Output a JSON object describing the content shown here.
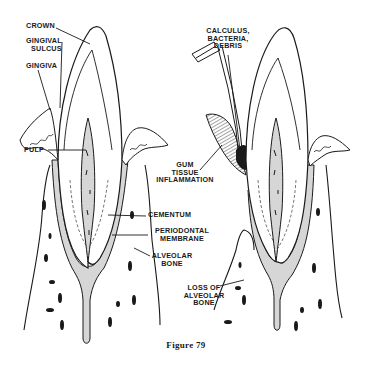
{
  "figure": {
    "caption": "Figure 79",
    "colors": {
      "ink": "#1a1a1a",
      "shading": "#d6d6d6",
      "background": "#ffffff"
    },
    "left_tooth": {
      "title": "Healthy tooth",
      "labels": {
        "crown": "CROWN",
        "gingival_sulcus_1": "GINGIVAL",
        "gingival_sulcus_2": "SULCUS",
        "gingiva": "GINGIVA",
        "pulp": "PULP",
        "cementum": "CEMENTUM",
        "periodontal_1": "PERIODONTAL",
        "periodontal_2": "MEMBRANE",
        "alveolar_1": "ALVEOLAR",
        "alveolar_2": "BONE"
      }
    },
    "right_tooth": {
      "title": "Diseased tooth",
      "labels": {
        "calculus_1": "CALCULUS,",
        "calculus_2": "BACTERIA,",
        "calculus_3": "DEBRIS",
        "gum_1": "GUM",
        "gum_2": "TISSUE",
        "gum_3": "INFLAMMATION",
        "loss_1": "LOSS OF",
        "loss_2": "ALVEOLAR",
        "loss_3": "BONE"
      }
    }
  }
}
